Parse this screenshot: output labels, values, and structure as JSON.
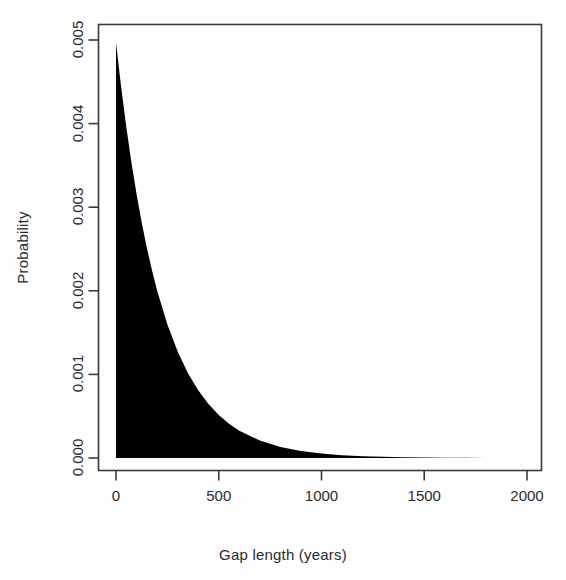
{
  "figure": {
    "background_color": "#fefefe",
    "ink_color": "#231f20"
  },
  "chart_data": {
    "type": "area",
    "title": "",
    "subtitle": "",
    "xlabel": "Gap length (years)",
    "ylabel": "Probability",
    "xlim": [
      -40,
      2070
    ],
    "ylim": [
      0,
      0.005143
    ],
    "grid": false,
    "legend": null,
    "fill_color": "#000000",
    "line_color": "#000000",
    "xticks": [
      0,
      500,
      1000,
      1500,
      2000
    ],
    "xtick_labels": [
      "0",
      "500",
      "1000",
      "1500",
      "2000"
    ],
    "yticks": [
      0.0,
      0.001,
      0.002,
      0.003,
      0.004,
      0.005
    ],
    "ytick_labels": [
      "0.000",
      "0.001",
      "0.002",
      "0.003",
      "0.004",
      "0.005"
    ],
    "peak_value": 0.00497,
    "decay_constant_years": 222,
    "x": [
      0,
      25,
      50,
      75,
      100,
      125,
      150,
      175,
      200,
      250,
      300,
      350,
      400,
      450,
      500,
      550,
      600,
      700,
      800,
      900,
      1000,
      1100,
      1200,
      1300,
      1400,
      1500,
      1600,
      1700,
      1800,
      1900,
      2000,
      2060
    ],
    "y": [
      0.00497,
      0.004437,
      0.003961,
      0.003536,
      0.003157,
      0.002818,
      0.002516,
      0.002246,
      0.002005,
      0.001598,
      0.001273,
      0.001015,
      0.000809,
      0.000645,
      0.000514,
      0.00041,
      0.000327,
      0.000208,
      0.000132,
      8.4e-05,
      5.33e-05,
      3.39e-05,
      2.15e-05,
      1.37e-05,
      8.7e-06,
      5.5e-06,
      3.5e-06,
      2.2e-06,
      1.4e-06,
      9e-07,
      6e-07,
      4e-07
    ]
  }
}
